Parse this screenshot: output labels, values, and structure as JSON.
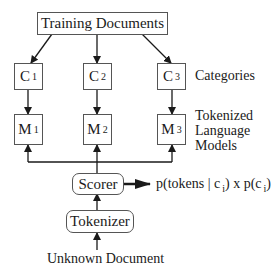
{
  "diagram": {
    "top_node": {
      "label": "Training Documents"
    },
    "categories": [
      {
        "letter": "C",
        "index": "1"
      },
      {
        "letter": "C",
        "index": "2"
      },
      {
        "letter": "C",
        "index": "3"
      }
    ],
    "models": [
      {
        "letter": "M",
        "index": "1"
      },
      {
        "letter": "M",
        "index": "2"
      },
      {
        "letter": "M",
        "index": "3"
      }
    ],
    "row_labels": {
      "categories": "Categories",
      "models_line1": "Tokenized",
      "models_line2": "Language",
      "models_line3": "Models"
    },
    "scorer": {
      "label": "Scorer"
    },
    "output": {
      "part1": "p(tokens | c",
      "sub1": "i",
      "part2": ") x p(c",
      "sub2": "i",
      "part3": ")"
    },
    "tokenizer": {
      "label": "Tokenizer"
    },
    "input": {
      "label": "Unknown Document"
    },
    "colors": {
      "line": "#1a1a1a",
      "border": "#555555",
      "background": "#ffffff"
    }
  }
}
